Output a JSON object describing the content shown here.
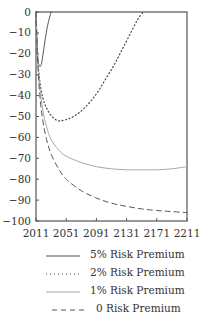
{
  "chart_data": {
    "type": "line",
    "title": "",
    "xlabel": "",
    "ylabel": "",
    "xlim": [
      2011,
      2211
    ],
    "ylim": [
      -100,
      0
    ],
    "grid": false,
    "legend_position": "below",
    "x_ticks": [
      "2011",
      "2051",
      "2091",
      "2131",
      "2171",
      "2211"
    ],
    "y_ticks": [
      "0",
      "−10",
      "−20",
      "−30",
      "−40",
      "−50",
      "−60",
      "−70",
      "−80",
      "−90",
      "−100"
    ],
    "series": [
      {
        "name": "5% Risk Premium",
        "style": "solid",
        "color": "#555555",
        "x": [
          2011,
          2012,
          2013,
          2014,
          2016,
          2018,
          2020,
          2022,
          2025,
          2028,
          2031
        ],
        "y": [
          0,
          -12,
          -20,
          -24,
          -26,
          -25,
          -21,
          -16,
          -9,
          -4,
          0
        ]
      },
      {
        "name": "2% Risk Premium",
        "style": "dotted",
        "color": "#444444",
        "x": [
          2011,
          2013,
          2016,
          2020,
          2025,
          2030,
          2035,
          2040,
          2045,
          2055,
          2065,
          2075,
          2085,
          2095,
          2105,
          2115,
          2125,
          2135,
          2145,
          2153
        ],
        "y": [
          0,
          -20,
          -33,
          -41,
          -46,
          -49,
          -51,
          -52,
          -52,
          -51,
          -49,
          -46,
          -42,
          -37,
          -31,
          -25,
          -18,
          -11,
          -4,
          0
        ]
      },
      {
        "name": "1% Risk Premium",
        "style": "solid-light",
        "color": "#999999",
        "x": [
          2011,
          2013,
          2016,
          2020,
          2025,
          2031,
          2041,
          2051,
          2071,
          2091,
          2111,
          2131,
          2151,
          2171,
          2191,
          2211
        ],
        "y": [
          0,
          -20,
          -36,
          -47,
          -55,
          -61,
          -66,
          -69,
          -72,
          -74,
          -75,
          -75.5,
          -75.5,
          -75.5,
          -75,
          -74
        ]
      },
      {
        "name": "0 Risk Premium",
        "style": "dashed",
        "color": "#555555",
        "x": [
          2011,
          2013,
          2016,
          2020,
          2025,
          2031,
          2041,
          2051,
          2071,
          2091,
          2111,
          2131,
          2151,
          2171,
          2191,
          2211
        ],
        "y": [
          0,
          -22,
          -40,
          -52,
          -61,
          -68,
          -75,
          -80,
          -85.5,
          -89,
          -91.5,
          -93,
          -94.2,
          -95,
          -95.5,
          -96
        ]
      }
    ]
  },
  "legend": [
    {
      "label": "5% Risk Premium",
      "style": "solid"
    },
    {
      "label": "2% Risk Premium",
      "style": "dotted"
    },
    {
      "label": "1% Risk Premium",
      "style": "solid-light"
    },
    {
      "label": "0 Risk Premium",
      "style": "dashed"
    }
  ]
}
